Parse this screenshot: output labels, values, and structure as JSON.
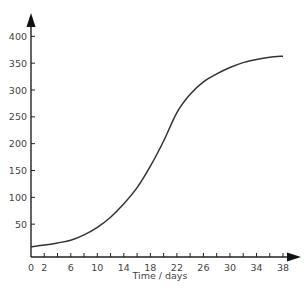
{
  "chart_data": {
    "type": "line",
    "title": "",
    "xlabel": "Time / days",
    "ylabel": "",
    "xlim": [
      0,
      38
    ],
    "ylim": [
      0,
      400
    ],
    "x_ticks": [
      0,
      2,
      4,
      6,
      8,
      10,
      12,
      14,
      16,
      18,
      20,
      22,
      24,
      26,
      28,
      30,
      32,
      34,
      36,
      38
    ],
    "x_tick_labels": [
      "0",
      "2",
      "6",
      "10",
      "14",
      "18",
      "22",
      "26",
      "30",
      "34",
      "38"
    ],
    "x_tick_label_values": [
      0,
      2,
      6,
      10,
      14,
      18,
      22,
      26,
      30,
      34,
      38
    ],
    "y_ticks": [
      50,
      100,
      150,
      200,
      250,
      300,
      350,
      400
    ],
    "y_tick_labels": [
      "50",
      "100",
      "150",
      "200",
      "250",
      "300",
      "350",
      "400"
    ],
    "grid": false,
    "legend": null,
    "series": [
      {
        "name": "growth curve",
        "x": [
          0,
          2,
          4,
          6,
          8,
          10,
          12,
          14,
          16,
          18,
          20,
          22,
          24,
          26,
          28,
          30,
          32,
          34,
          36,
          38
        ],
        "values": [
          8,
          11,
          15,
          20,
          30,
          44,
          63,
          88,
          118,
          158,
          205,
          258,
          292,
          315,
          330,
          342,
          351,
          357,
          361,
          363
        ]
      }
    ],
    "colors": {
      "axis": "#222222",
      "line": "#333333",
      "text": "#444444"
    }
  }
}
